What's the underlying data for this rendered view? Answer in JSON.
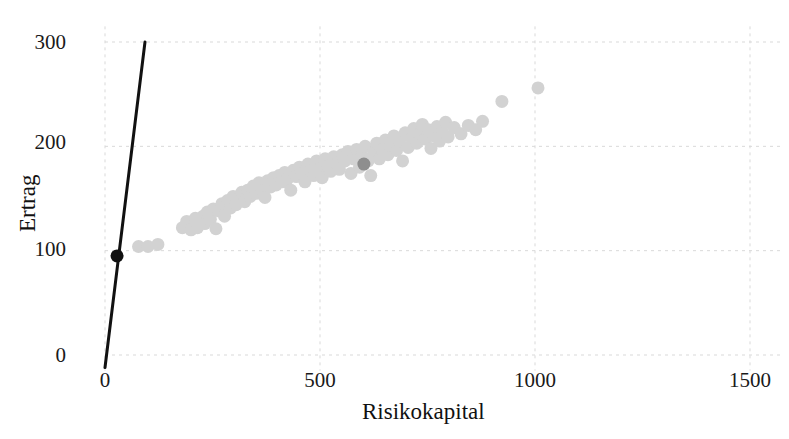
{
  "chart_data": {
    "type": "scatter",
    "title": "",
    "xlabel": "Risikokapital",
    "ylabel": "Ertrag",
    "xlim": [
      0,
      1570
    ],
    "ylim": [
      -15,
      315
    ],
    "xticks": [
      0,
      500,
      1000,
      1500
    ],
    "xtick_labels": [
      "0",
      "500",
      "1000",
      "1500"
    ],
    "yticks": [
      0,
      100,
      200,
      300
    ],
    "ytick_labels": [
      "0",
      "100",
      "200",
      "300"
    ],
    "grid": true,
    "grid_style": "dashed",
    "grid_color": "#d9d9d9",
    "legend": "none",
    "background": "#ffffff",
    "series": [
      {
        "name": "portfolio-cloud",
        "type": "scatter",
        "color": "#d2d2d2",
        "marker": "circle",
        "marker_size": 13,
        "points": [
          [
            78,
            104
          ],
          [
            100,
            104
          ],
          [
            123,
            106
          ],
          [
            180,
            122
          ],
          [
            190,
            128
          ],
          [
            200,
            120
          ],
          [
            210,
            131
          ],
          [
            215,
            122
          ],
          [
            228,
            133
          ],
          [
            232,
            126
          ],
          [
            238,
            137
          ],
          [
            245,
            130
          ],
          [
            252,
            140
          ],
          [
            258,
            121
          ],
          [
            265,
            138
          ],
          [
            272,
            145
          ],
          [
            278,
            133
          ],
          [
            285,
            148
          ],
          [
            292,
            141
          ],
          [
            298,
            152
          ],
          [
            305,
            144
          ],
          [
            312,
            150
          ],
          [
            318,
            156
          ],
          [
            325,
            147
          ],
          [
            332,
            158
          ],
          [
            338,
            152
          ],
          [
            345,
            162
          ],
          [
            352,
            155
          ],
          [
            358,
            165
          ],
          [
            365,
            158
          ],
          [
            372,
            151
          ],
          [
            378,
            167
          ],
          [
            385,
            161
          ],
          [
            392,
            170
          ],
          [
            398,
            163
          ],
          [
            405,
            172
          ],
          [
            412,
            166
          ],
          [
            418,
            175
          ],
          [
            425,
            169
          ],
          [
            432,
            158
          ],
          [
            438,
            177
          ],
          [
            445,
            171
          ],
          [
            452,
            180
          ],
          [
            458,
            174
          ],
          [
            465,
            166
          ],
          [
            472,
            183
          ],
          [
            478,
            176
          ],
          [
            485,
            172
          ],
          [
            492,
            186
          ],
          [
            498,
            178
          ],
          [
            505,
            170
          ],
          [
            512,
            188
          ],
          [
            518,
            181
          ],
          [
            525,
            176
          ],
          [
            532,
            190
          ],
          [
            538,
            183
          ],
          [
            545,
            178
          ],
          [
            552,
            192
          ],
          [
            558,
            186
          ],
          [
            565,
            195
          ],
          [
            572,
            174
          ],
          [
            578,
            188
          ],
          [
            585,
            197
          ],
          [
            592,
            180
          ],
          [
            598,
            191
          ],
          [
            605,
            200
          ],
          [
            612,
            186
          ],
          [
            618,
            172
          ],
          [
            625,
            194
          ],
          [
            632,
            203
          ],
          [
            638,
            188
          ],
          [
            645,
            197
          ],
          [
            652,
            206
          ],
          [
            658,
            192
          ],
          [
            665,
            201
          ],
          [
            672,
            210
          ],
          [
            678,
            196
          ],
          [
            685,
            205
          ],
          [
            692,
            186
          ],
          [
            698,
            213
          ],
          [
            705,
            199
          ],
          [
            712,
            208
          ],
          [
            718,
            217
          ],
          [
            725,
            203
          ],
          [
            732,
            212
          ],
          [
            738,
            221
          ],
          [
            745,
            207
          ],
          [
            752,
            216
          ],
          [
            758,
            198
          ],
          [
            765,
            210
          ],
          [
            772,
            219
          ],
          [
            778,
            205
          ],
          [
            785,
            214
          ],
          [
            792,
            223
          ],
          [
            798,
            209
          ],
          [
            812,
            218
          ],
          [
            828,
            212
          ],
          [
            845,
            220
          ],
          [
            862,
            216
          ],
          [
            878,
            224
          ],
          [
            923,
            243
          ],
          [
            1007,
            256
          ]
        ]
      },
      {
        "name": "highlighted-portfolio",
        "type": "scatter",
        "color": "#8e8e8e",
        "marker": "circle",
        "marker_size": 13,
        "points": [
          [
            602,
            183
          ]
        ]
      },
      {
        "name": "risk-free-asset",
        "type": "scatter",
        "color": "#111111",
        "marker": "circle",
        "marker_size": 13,
        "points": [
          [
            28,
            95
          ]
        ]
      },
      {
        "name": "capital-market-line",
        "type": "line",
        "color": "#111111",
        "line_width": 3,
        "points": [
          [
            0,
            -12
          ],
          [
            93,
            300
          ]
        ]
      }
    ]
  },
  "axes": {
    "x_title": "Risikokapital",
    "y_title": "Ertrag",
    "x_tick_labels": [
      "0",
      "500",
      "1000",
      "1500"
    ],
    "y_tick_labels": [
      "0",
      "100",
      "200",
      "300"
    ]
  }
}
